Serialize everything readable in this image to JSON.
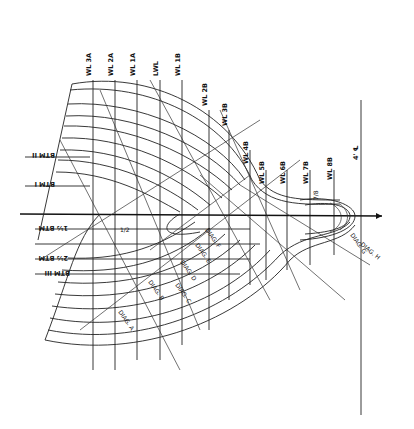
{
  "drawing": {
    "type": "ship lines body plan",
    "centerline_label": "℄",
    "waterline_labels": [
      {
        "label": "WL 3A",
        "x": 93
      },
      {
        "label": "WL 2A",
        "x": 115
      },
      {
        "label": "WL 1A",
        "x": 137
      },
      {
        "label": "LWL",
        "x": 160
      },
      {
        "label": "WL 1B",
        "x": 182
      },
      {
        "label": "WL 2B",
        "x": 209
      },
      {
        "label": "WL 3B",
        "x": 229
      },
      {
        "label": "WL 4B",
        "x": 250
      },
      {
        "label": "WL 5B",
        "x": 266
      },
      {
        "label": "WL 6B",
        "x": 287
      },
      {
        "label": "WL 7B",
        "x": 310
      },
      {
        "label": "WL 8B",
        "x": 334
      }
    ],
    "station_labels": [
      {
        "label": "BTM II",
        "y": 157
      },
      {
        "label": "BTM I",
        "y": 186
      },
      {
        "label": "1½ BTM",
        "y": 229
      },
      {
        "label": "2½ BTM",
        "y": 259
      },
      {
        "label": "BTM III",
        "y": 274
      }
    ],
    "diagonal_labels": [
      "DIAG. A",
      "DIAG. B",
      "DIAG. C",
      "DIAG. D",
      "DIAG. E",
      "DIAG. F",
      "DIAG. G",
      "DIAG. H"
    ],
    "misc_labels": [
      "4' ℄",
      "7/8",
      "1/2",
      "1/2"
    ]
  }
}
